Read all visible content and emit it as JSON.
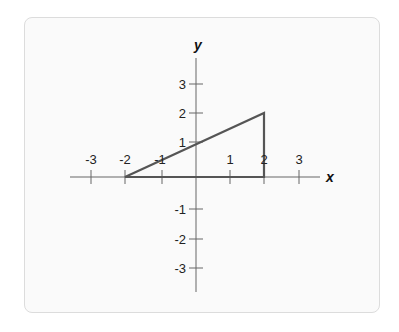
{
  "diagram": {
    "type": "coordinate-plane",
    "axes": {
      "x_label": "x",
      "y_label": "y",
      "x_ticks": [
        "-3",
        "-2",
        "-1",
        "1",
        "2",
        "3"
      ],
      "y_ticks": [
        "3",
        "2",
        "1",
        "-1",
        "-2",
        "-3"
      ]
    },
    "shape": {
      "type": "triangle",
      "vertices": [
        [
          -2,
          0
        ],
        [
          2,
          0
        ],
        [
          2,
          2
        ]
      ]
    },
    "colors": {
      "axis": "#666666",
      "shape": "#555555",
      "background": "#fafafa"
    }
  }
}
